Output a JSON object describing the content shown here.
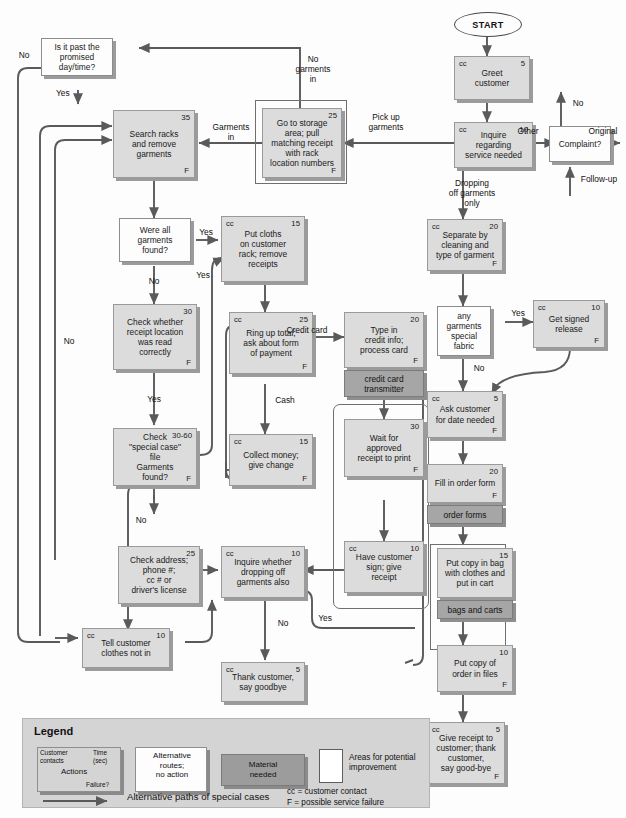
{
  "diagram": {
    "start_label": "START",
    "colors": {
      "action_fill": "#dcdcdc",
      "material_fill": "#a6a6a6",
      "decision_fill": "#fdfdfd",
      "legend_fill": "#d4d4d4",
      "line": "#595959"
    }
  },
  "nodes": {
    "greet": {
      "cc": "cc",
      "time": "5",
      "text": "Greet\ncustomer",
      "failure": ""
    },
    "inquire_service": {
      "cc": "cc",
      "time": "10",
      "text": "Inquire\nregarding\nservice needed",
      "failure": ""
    },
    "storage": {
      "cc": "",
      "time": "25",
      "text": "Go to storage\narea; pull\nmatching receipt\nwith rack\nlocation numbers",
      "failure": "F"
    },
    "search_racks": {
      "cc": "",
      "time": "35",
      "text": "Search racks\nand remove\ngarments",
      "failure": "F"
    },
    "put_cloths": {
      "cc": "cc",
      "time": "15",
      "text": "Put cloths\non customer\nrack; remove\nreceipts",
      "failure": ""
    },
    "check_receipt": {
      "cc": "",
      "time": "30",
      "text": "Check whether\nreceipt location\nwas read\ncorrectly",
      "failure": "F"
    },
    "ring_up": {
      "cc": "cc",
      "time": "25",
      "text": "Ring up total;\nask about form\nof payment",
      "failure": "F"
    },
    "collect_money": {
      "cc": "cc",
      "time": "15",
      "text": "Collect money;\ngive change",
      "failure": "F"
    },
    "type_credit": {
      "cc": "",
      "time": "20",
      "text": "Type in\ncredit info;\nprocess card",
      "failure": "F"
    },
    "wait_receipt": {
      "cc": "",
      "time": "30",
      "text": "Wait for\napproved\nreceipt to print",
      "failure": "F"
    },
    "have_sign": {
      "cc": "cc",
      "time": "10",
      "text": "Have customer\nsign; give\nreceipt",
      "failure": ""
    },
    "separate": {
      "cc": "cc",
      "time": "20",
      "text": "Separate by\ncleaning and\ntype of garment",
      "failure": "F"
    },
    "signed_release": {
      "cc": "cc",
      "time": "10",
      "text": "Get signed\nrelease",
      "failure": "F"
    },
    "ask_date": {
      "cc": "cc",
      "time": "5",
      "text": "Ask customer\nfor date needed",
      "failure": "F"
    },
    "fill_order": {
      "cc": "",
      "time": "20",
      "text": "Fill in order form",
      "failure": "F"
    },
    "put_copy_bag": {
      "cc": "",
      "time": "15",
      "text": "Put copy in bag\nwith clothes and\nput in cart",
      "failure": ""
    },
    "put_copy_files": {
      "cc": "",
      "time": "10",
      "text": "Put copy of\norder in files",
      "failure": "F"
    },
    "give_receipt": {
      "cc": "cc",
      "time": "5",
      "text": "Give receipt to\ncustomer; thank\ncustomer,\nsay good-bye",
      "failure": "F"
    },
    "check_address": {
      "cc": "",
      "time": "25",
      "text": "Check address;\nphone #;\ncc # or\ndriver's license",
      "failure": ""
    },
    "inquire_dropping": {
      "cc": "cc",
      "time": "10",
      "text": "Inquire whether\ndropping off\ngarments also",
      "failure": ""
    },
    "tell_not_in": {
      "cc": "cc",
      "time": "10",
      "text": "Tell customer\nclothes not in",
      "failure": ""
    },
    "thank_customer": {
      "cc": "cc",
      "time": "5",
      "text": "Thank customer,\nsay goodbye",
      "failure": ""
    },
    "special_case": {
      "cc": "",
      "time": "30-60",
      "text": "Check\n\"special case\"\nfile\nGarments\nfound?",
      "failure": "F"
    }
  },
  "decisions": {
    "past_promised": "Is it past the\npromised\nday/time?",
    "all_found": "Were all\ngarments\nfound?",
    "complaint": "Complaint?",
    "special_fabric": "any\ngarments\nspecial\nfabric"
  },
  "materials": {
    "cc_transmitter": "credit card\ntransmitter",
    "order_forms": "order forms",
    "bags_carts": "bags and carts"
  },
  "edge_labels": {
    "no_top_left": "No",
    "yes_past": "Yes",
    "no_garments_in": "No\ngarments\nin",
    "garments_in": "Garments\nin",
    "pick_up": "Pick up\ngarments",
    "other": "Other",
    "original": "Original",
    "no_complaint": "No",
    "follow_up": "Follow-up",
    "dropping_only": "Dropping\noff garments\nonly",
    "yes_all_found": "Yes",
    "no_all_found": "No",
    "no_receipt": "No",
    "yes_receipt": "Yes",
    "yes_special": "Yes",
    "credit_card": "Credit card",
    "cash": "Cash",
    "yes_special_fabric": "Yes",
    "no_special_fabric": "No",
    "no_special_case": "No",
    "no_dropping": "No",
    "yes_dropping": "Yes"
  },
  "legend": {
    "title": "Legend",
    "action_customer_contacts": "Customer\ncontacts",
    "action_time": "Time\n(sec)",
    "action_label": "Actions",
    "action_failure": "Failure?",
    "alternative": "Alternative\nroutes;\nno action",
    "material": "Material\nneeded",
    "improvement": "Areas for potential\nimprovement",
    "alt_paths": "Alternative paths of special cases",
    "cc_key": "cc = customer contact",
    "f_key": "F = possible service failure"
  }
}
